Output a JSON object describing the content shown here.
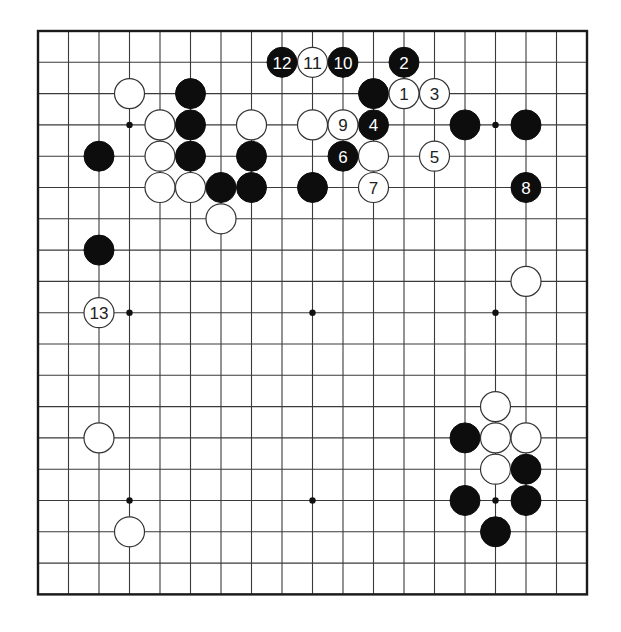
{
  "board": {
    "size": 19,
    "origin_px": {
      "x": 38,
      "y": 31
    },
    "spacing_px": {
      "x": 30.5,
      "y": 31.3
    },
    "stone_radius_px": 15,
    "colors": {
      "background": "#ffffff",
      "grid": "#3a3a3a",
      "border": "#1a1a1a",
      "black_stone": "#0d0d0d",
      "white_stone": "#ffffff",
      "white_stone_outline": "#333333"
    },
    "star_points": [
      {
        "col": 3,
        "row": 3
      },
      {
        "col": 9,
        "row": 3
      },
      {
        "col": 15,
        "row": 3
      },
      {
        "col": 3,
        "row": 9
      },
      {
        "col": 9,
        "row": 9
      },
      {
        "col": 15,
        "row": 9
      },
      {
        "col": 3,
        "row": 15
      },
      {
        "col": 9,
        "row": 15
      },
      {
        "col": 15,
        "row": 15
      }
    ],
    "stones": [
      {
        "color": "white",
        "col": 3,
        "row": 2,
        "label": ""
      },
      {
        "color": "black",
        "col": 5,
        "row": 2,
        "label": ""
      },
      {
        "color": "white",
        "col": 4,
        "row": 3,
        "label": ""
      },
      {
        "color": "black",
        "col": 5,
        "row": 3,
        "label": ""
      },
      {
        "color": "white",
        "col": 7,
        "row": 3,
        "label": ""
      },
      {
        "color": "black",
        "col": 2,
        "row": 4,
        "label": ""
      },
      {
        "color": "white",
        "col": 4,
        "row": 4,
        "label": ""
      },
      {
        "color": "black",
        "col": 5,
        "row": 4,
        "label": ""
      },
      {
        "color": "black",
        "col": 7,
        "row": 4,
        "label": ""
      },
      {
        "color": "white",
        "col": 4,
        "row": 5,
        "label": ""
      },
      {
        "color": "white",
        "col": 5,
        "row": 5,
        "label": ""
      },
      {
        "color": "black",
        "col": 6,
        "row": 5,
        "label": ""
      },
      {
        "color": "black",
        "col": 7,
        "row": 5,
        "label": ""
      },
      {
        "color": "white",
        "col": 6,
        "row": 6,
        "label": ""
      },
      {
        "color": "black",
        "col": 2,
        "row": 7,
        "label": ""
      },
      {
        "color": "white",
        "col": 9,
        "row": 3,
        "label": ""
      },
      {
        "color": "black",
        "col": 9,
        "row": 5,
        "label": ""
      },
      {
        "color": "black",
        "col": 11,
        "row": 2,
        "label": ""
      },
      {
        "color": "white",
        "col": 11,
        "row": 4,
        "label": ""
      },
      {
        "color": "black",
        "col": 14,
        "row": 3,
        "label": ""
      },
      {
        "color": "black",
        "col": 16,
        "row": 3,
        "label": ""
      },
      {
        "color": "white",
        "col": 16,
        "row": 8,
        "label": ""
      },
      {
        "color": "white",
        "col": 2,
        "row": 13,
        "label": ""
      },
      {
        "color": "white",
        "col": 3,
        "row": 16,
        "label": ""
      },
      {
        "color": "white",
        "col": 15,
        "row": 12,
        "label": ""
      },
      {
        "color": "black",
        "col": 14,
        "row": 13,
        "label": ""
      },
      {
        "color": "white",
        "col": 15,
        "row": 13,
        "label": ""
      },
      {
        "color": "white",
        "col": 16,
        "row": 13,
        "label": ""
      },
      {
        "color": "white",
        "col": 15,
        "row": 14,
        "label": ""
      },
      {
        "color": "black",
        "col": 16,
        "row": 14,
        "label": ""
      },
      {
        "color": "black",
        "col": 14,
        "row": 15,
        "label": ""
      },
      {
        "color": "black",
        "col": 16,
        "row": 15,
        "label": ""
      },
      {
        "color": "black",
        "col": 15,
        "row": 16,
        "label": ""
      },
      {
        "color": "white",
        "col": 12,
        "row": 2,
        "label": "1"
      },
      {
        "color": "black",
        "col": 12,
        "row": 1,
        "label": "2"
      },
      {
        "color": "white",
        "col": 13,
        "row": 2,
        "label": "3"
      },
      {
        "color": "black",
        "col": 11,
        "row": 3,
        "label": "4"
      },
      {
        "color": "white",
        "col": 13,
        "row": 4,
        "label": "5"
      },
      {
        "color": "black",
        "col": 10,
        "row": 4,
        "label": "6"
      },
      {
        "color": "white",
        "col": 11,
        "row": 5,
        "label": "7"
      },
      {
        "color": "black",
        "col": 16,
        "row": 5,
        "label": "8"
      },
      {
        "color": "white",
        "col": 10,
        "row": 3,
        "label": "9"
      },
      {
        "color": "black",
        "col": 10,
        "row": 1,
        "label": "10"
      },
      {
        "color": "white",
        "col": 9,
        "row": 1,
        "label": "11"
      },
      {
        "color": "black",
        "col": 8,
        "row": 1,
        "label": "12"
      },
      {
        "color": "white",
        "col": 2,
        "row": 9,
        "label": "13"
      }
    ]
  }
}
